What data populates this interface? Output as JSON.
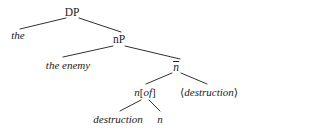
{
  "figure": {
    "kind": "syntax-tree",
    "ink_color": "#1a1a1a",
    "background_color": "#ffffff"
  },
  "nodes": {
    "dp": {
      "label": "DP",
      "style": "upright",
      "x": 72,
      "y": 13
    },
    "det": {
      "label": "the",
      "style": "italic",
      "x": 18,
      "y": 36
    },
    "np": {
      "label": "nP",
      "style": "upright",
      "x": 119,
      "y": 40
    },
    "subject": {
      "label": "the enemy",
      "style": "italic",
      "x": 68,
      "y": 66
    },
    "nbar": {
      "label": "n",
      "overbar": true,
      "style": "italic",
      "x": 176,
      "y": 67
    },
    "little_n": {
      "label": "n[of]",
      "italic_part_1": "n",
      "bracket_open": "[",
      "italic_part_2": "of",
      "bracket_close": "]",
      "x": 145,
      "y": 93
    },
    "copy": {
      "label": "⟨destruction⟩",
      "bracket_open": "⟨",
      "text": "destruction",
      "bracket_close": "⟩",
      "style": "italic",
      "x": 209,
      "y": 93
    },
    "root_noun": {
      "label": "destruction",
      "style": "italic",
      "x": 118,
      "y": 120
    },
    "moved_n": {
      "label": "n",
      "style": "italic",
      "x": 160,
      "y": 120
    }
  },
  "edges": [
    {
      "name": "dp-to-the",
      "from": "dp",
      "to": "det",
      "x1": 66,
      "y1": 18,
      "x2": 20,
      "y2": 29
    },
    {
      "name": "dp-to-np",
      "from": "dp",
      "to": "np",
      "x1": 79,
      "y1": 18,
      "x2": 121,
      "y2": 32
    },
    {
      "name": "np-to-subject",
      "from": "np",
      "to": "subject",
      "x1": 113,
      "y1": 46,
      "x2": 63,
      "y2": 57
    },
    {
      "name": "np-to-nbar",
      "from": "np",
      "to": "nbar",
      "x1": 125,
      "y1": 46,
      "x2": 180,
      "y2": 59
    },
    {
      "name": "nbar-to-n-of",
      "from": "nbar",
      "to": "little_n",
      "x1": 172,
      "y1": 73,
      "x2": 146,
      "y2": 84
    },
    {
      "name": "nbar-to-copy",
      "from": "nbar",
      "to": "copy",
      "x1": 181,
      "y1": 73,
      "x2": 207,
      "y2": 84
    },
    {
      "name": "n-of-to-root",
      "from": "little_n",
      "to": "root_noun",
      "x1": 141,
      "y1": 100,
      "x2": 120,
      "y2": 111
    },
    {
      "name": "n-of-to-moved-n",
      "from": "little_n",
      "to": "moved_n",
      "x1": 149,
      "y1": 100,
      "x2": 160,
      "y2": 111
    }
  ]
}
